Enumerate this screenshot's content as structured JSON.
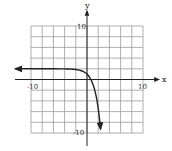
{
  "chart_data": {
    "type": "line",
    "title": "",
    "xlabel": "x",
    "ylabel": "y",
    "xlim": [
      -10,
      10
    ],
    "ylim": [
      -10,
      10
    ],
    "grid": true,
    "grid_step": 2,
    "tick_labels": {
      "x": [
        "-10",
        "10"
      ],
      "y": [
        "10",
        "-10"
      ]
    },
    "series": [
      {
        "name": "f(x) = 2 - e^x",
        "horizontal_asymptote": 2,
        "x": [
          -12,
          -6,
          -4,
          -2,
          -1,
          0,
          0.69,
          1,
          1.5,
          2,
          2.5
        ],
        "values": [
          2,
          2.0,
          1.98,
          1.86,
          1.63,
          1,
          0,
          -0.72,
          -2.48,
          -5.39,
          -10.18
        ],
        "left_arrow": true,
        "right_arrow": true
      }
    ]
  },
  "labels": {
    "x_axis": "x",
    "y_axis": "y",
    "x_min": "-10",
    "x_max": "10",
    "y_max": "10",
    "y_min": "-10"
  }
}
